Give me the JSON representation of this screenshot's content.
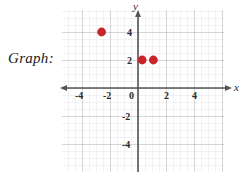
{
  "label": {
    "text": "Graph:"
  },
  "chart_data": {
    "type": "scatter",
    "title": "",
    "xlabel": "x",
    "ylabel": "y",
    "xlim": [
      -5.4,
      6.2
    ],
    "ylim": [
      -6.0,
      5.6
    ],
    "grid": true,
    "grid_minor_step": 0.5,
    "grid_major_step": 2,
    "legend": "none",
    "xticks": [
      -4,
      -2,
      0,
      2,
      4
    ],
    "xtick_labels": [
      "-4",
      "-2",
      "0",
      "2",
      "4"
    ],
    "yticks": [
      4,
      2,
      -2,
      -4
    ],
    "ytick_labels": [
      "4",
      "2",
      "-2",
      "-4"
    ],
    "origin_label": "0",
    "point_color": "#c8252a",
    "points": [
      {
        "x": -2.6,
        "y": 4.0
      },
      {
        "x": 0.3,
        "y": 2.0
      },
      {
        "x": 1.1,
        "y": 2.0
      }
    ]
  }
}
